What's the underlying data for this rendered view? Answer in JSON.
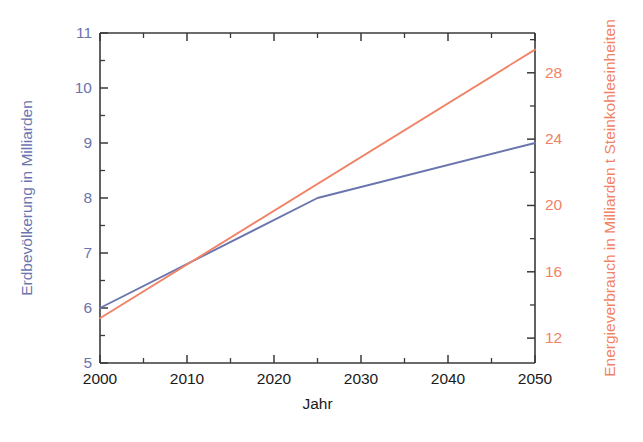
{
  "chart_data": {
    "type": "line",
    "title": "",
    "subtitle": "",
    "xlabel": "Jahr",
    "xlim": [
      2000,
      2050
    ],
    "xticks": [
      2000,
      2010,
      2020,
      2030,
      2040,
      2050
    ],
    "xticklabels": [
      "2000",
      "2010",
      "2020",
      "2030",
      "2040",
      "2050"
    ],
    "x_minor_tick_step": 5,
    "grid": false,
    "legend": "none",
    "axes": [
      {
        "id": "left",
        "label": "Erdbevölkerung in Milliarden",
        "color": "#6a74ad",
        "ylim": [
          5,
          11
        ],
        "yticks": [
          5,
          6,
          7,
          8,
          9,
          10,
          11
        ],
        "yticklabels": [
          "5",
          "6",
          "7",
          "8",
          "9",
          "10",
          "11"
        ],
        "y_minor_tick_step": 0.5
      },
      {
        "id": "right",
        "label": "Energieverbrauch in Milliarden t Steinkohleeinheiten",
        "color": "#f08366",
        "ylim": [
          10.5,
          30.4
        ],
        "yticks": [
          12,
          16,
          20,
          24,
          28
        ],
        "yticklabels": [
          "12",
          "16",
          "20",
          "24",
          "28"
        ],
        "y_minor_tick_step": 2
      }
    ],
    "series": [
      {
        "name": "Erdbevölkerung in Milliarden",
        "axis": "left",
        "color": "#6a74ad",
        "x": [
          2000,
          2025,
          2050
        ],
        "values": [
          6.0,
          8.0,
          9.0
        ]
      },
      {
        "name": "Energieverbrauch in Milliarden t Steinkohleeinheiten",
        "axis": "right",
        "color": "#f08366",
        "x": [
          2000,
          2050
        ],
        "values": [
          13.2,
          29.4
        ]
      }
    ]
  },
  "figure": {
    "background": "#ffffff",
    "frame_color": "#3a3a3a",
    "xtick_label_color": "#1a1a1a",
    "xlabel_color": "#1a1a1a"
  }
}
